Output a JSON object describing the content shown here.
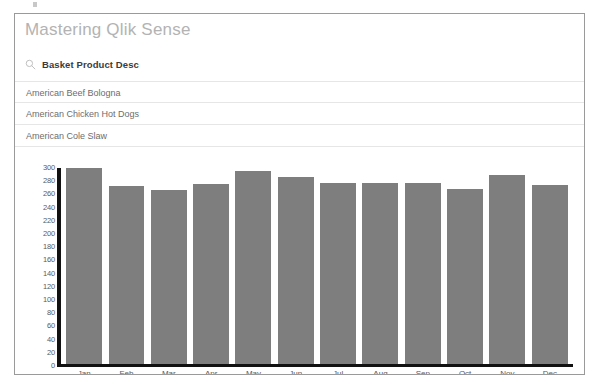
{
  "app": {
    "sheet_title": "Mastering Qlik Sense"
  },
  "filter_pane": {
    "search_icon": "search-icon",
    "field_name": "Basket Product Desc",
    "items": [
      {
        "label": "American Beef Bologna"
      },
      {
        "label": "American Chicken Hot Dogs"
      },
      {
        "label": "American Cole Slaw"
      }
    ]
  },
  "chart_data": {
    "type": "bar",
    "title": "",
    "xlabel": "",
    "ylabel": "",
    "categories": [
      "Jan",
      "Feb",
      "Mar",
      "Apr",
      "May",
      "Jun",
      "Jul",
      "Aug",
      "Sep",
      "Oct",
      "Nov",
      "Dec"
    ],
    "values": [
      300,
      272,
      266,
      276,
      295,
      286,
      278,
      277,
      277,
      268,
      289,
      274
    ],
    "ylim": [
      0,
      300
    ],
    "ytick_step": 20,
    "yticks": [
      300,
      280,
      260,
      240,
      220,
      200,
      180,
      160,
      140,
      120,
      100,
      80,
      60,
      40,
      20,
      0
    ],
    "grid": false,
    "legend": "none",
    "bar_color": "#7e7e7e",
    "axis_color": "#111111"
  }
}
